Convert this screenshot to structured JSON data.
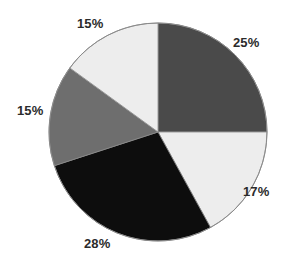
{
  "chart_data": {
    "type": "pie",
    "title": "",
    "subtitle": "",
    "xlabel": "",
    "ylabel": "",
    "grid": false,
    "legend": "none",
    "label_format": "percent",
    "start_angle_deg": 0,
    "direction": "clockwise",
    "center": {
      "x": 158,
      "y": 132
    },
    "radius": 109,
    "categories": [
      "Segment 1",
      "Segment 2",
      "Segment 3",
      "Segment 4",
      "Segment 5"
    ],
    "values": [
      25,
      17,
      28,
      15,
      15
    ],
    "labels": [
      "25%",
      "17%",
      "28%",
      "15%",
      "15%"
    ],
    "colors": [
      "#4a4a4a",
      "#ededed",
      "#0d0d0d",
      "#6e6e6e",
      "#ededed"
    ],
    "slices": [
      {
        "label": "25%",
        "value": 25,
        "color": "#4a4a4a",
        "start_deg": 0,
        "end_deg": 90
      },
      {
        "label": "17%",
        "value": 17,
        "color": "#ededed",
        "start_deg": 90,
        "end_deg": 151.2
      },
      {
        "label": "28%",
        "value": 28,
        "color": "#0d0d0d",
        "start_deg": 151.2,
        "end_deg": 252
      },
      {
        "label": "15%",
        "value": 15,
        "color": "#6e6e6e",
        "start_deg": 252,
        "end_deg": 306
      },
      {
        "label": "15%",
        "value": 15,
        "color": "#ededed",
        "start_deg": 306,
        "end_deg": 360
      }
    ],
    "outline_color": "#8a8a8a",
    "background": "#ffffff",
    "label_color": "#2b2b2b",
    "total": 100
  }
}
